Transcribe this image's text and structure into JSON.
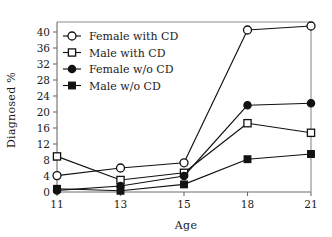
{
  "chart_data": {
    "type": "line",
    "title": "",
    "xlabel": "Age",
    "ylabel": "Diagnosed %",
    "categories": [
      "11",
      "13",
      "15",
      "18",
      "21"
    ],
    "x_tick_labels": [
      "11",
      "13",
      "15",
      "18",
      "21"
    ],
    "y_tick_labels": [
      "0",
      "4",
      "8",
      "12",
      "16",
      "20",
      "24",
      "28",
      "32",
      "36",
      "40"
    ],
    "y_ticks": [
      0,
      4,
      8,
      12,
      16,
      20,
      24,
      28,
      32,
      36,
      40
    ],
    "ylim": [
      0,
      42.5
    ],
    "grid": false,
    "legend_position": "upper left",
    "series": [
      {
        "name": "Female with CD",
        "marker": "open-circle",
        "values": [
          4.1,
          6.0,
          7.3,
          40.5,
          41.5
        ]
      },
      {
        "name": "Male with CD",
        "marker": "open-square",
        "values": [
          8.9,
          3.0,
          4.8,
          17.2,
          14.8
        ]
      },
      {
        "name": "Female w/o CD",
        "marker": "filled-circle",
        "values": [
          0.4,
          1.5,
          4.0,
          21.7,
          22.2
        ]
      },
      {
        "name": "Male w/o CD",
        "marker": "filled-square",
        "values": [
          0.8,
          0.3,
          1.9,
          8.2,
          9.5
        ]
      }
    ]
  },
  "legend": {
    "entries": [
      {
        "label": "Female with CD"
      },
      {
        "label": "Male with CD"
      },
      {
        "label": "Female w/o CD"
      },
      {
        "label": "Male w/o CD"
      }
    ]
  },
  "axes": {
    "y_label": "Diagnosed %",
    "x_label": "Age"
  }
}
